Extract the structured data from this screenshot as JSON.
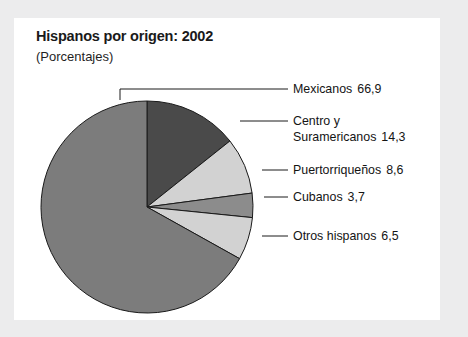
{
  "chart_data": {
    "type": "pie",
    "title": "Hispanos por origen: 2002",
    "subtitle": "(Porcentajes)",
    "unit": "porcentaje",
    "categories": [
      "Mexicanos",
      "Centro y Suramericanos",
      "Puertorriqueños",
      "Cubanos",
      "Otros hispanos"
    ],
    "values": [
      66.9,
      14.3,
      8.6,
      3.7,
      6.5
    ],
    "value_labels": [
      "66,9",
      "14,3",
      "8,6",
      "3,7",
      "6,5"
    ],
    "start_angle_deg": 0,
    "direction": "clockwise",
    "legend_position": "right-callout",
    "grid": false,
    "slices": [
      {
        "name": "centro-y-suramericanos",
        "label_line1": "Centro y",
        "label_line2": "Suramericanos",
        "value_label": "14,3",
        "value": 14.3,
        "color": "#4a4a4a"
      },
      {
        "name": "puertorriquenos",
        "label_line1": "Puertorriqueños",
        "label_line2": "",
        "value_label": "8,6",
        "value": 8.6,
        "color": "#d2d2d2"
      },
      {
        "name": "cubanos",
        "label_line1": "Cubanos",
        "label_line2": "",
        "value_label": "3,7",
        "value": 3.7,
        "color": "#8c8c8c"
      },
      {
        "name": "otros-hispanos",
        "label_line1": "Otros hispanos",
        "label_line2": "",
        "value_label": "6,5",
        "value": 6.5,
        "color": "#d2d2d2"
      },
      {
        "name": "mexicanos",
        "label_line1": "Mexicanos",
        "label_line2": "",
        "value_label": "66,9",
        "value": 66.9,
        "color": "#7c7c7c"
      }
    ]
  },
  "labels": {
    "mexicanos": {
      "text": "Mexicanos",
      "value": "66,9"
    },
    "centro_suramericanos": {
      "line1": "Centro y",
      "line2": "Suramericanos",
      "value": "14,3"
    },
    "puertorriquenos": {
      "text": "Puertorriqueños",
      "value": "8,6"
    },
    "cubanos": {
      "text": "Cubanos",
      "value": "3,7"
    },
    "otros_hispanos": {
      "text": "Otros hispanos",
      "value": "6,5"
    }
  },
  "colors": {
    "page_background": "#ececed",
    "card_background": "#ffffff",
    "outline": "#1a1a1a",
    "text": "#141414",
    "mexicanos": "#7c7c7c",
    "centro_suramericanos": "#4a4a4a",
    "puertorriquenos": "#d2d2d2",
    "cubanos": "#8c8c8c",
    "otros_hispanos": "#d2d2d2"
  }
}
